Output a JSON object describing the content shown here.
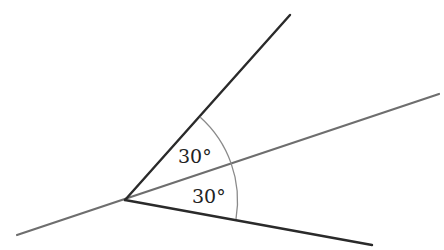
{
  "diagram": {
    "labels": {
      "upper_angle": "30°",
      "lower_angle": "30°"
    },
    "colors": {
      "dark_line": "#2a2a2a",
      "gray_line": "#6e6e6e",
      "arc": "#8a8a8a"
    }
  }
}
